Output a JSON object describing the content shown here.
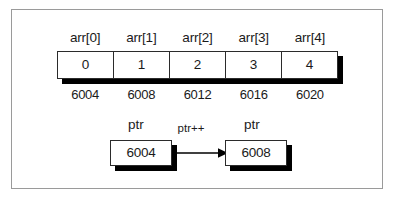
{
  "diagram": {
    "array": {
      "index_labels": [
        "arr[0]",
        "arr[1]",
        "arr[2]",
        "arr[3]",
        "arr[4]"
      ],
      "values": [
        "0",
        "1",
        "2",
        "3",
        "4"
      ],
      "addresses": [
        "6004",
        "6008",
        "6012",
        "6016",
        "6020"
      ]
    },
    "pointer": {
      "before_label": "ptr",
      "before_value": "6004",
      "operation_label": "ptr++",
      "after_label": "ptr",
      "after_value": "6008"
    },
    "colors": {
      "frame_border": "#9a9a9a",
      "box_border": "#2b2b2b",
      "shadow": "#000000",
      "text": "#1a1a1a",
      "background": "#ffffff"
    }
  }
}
